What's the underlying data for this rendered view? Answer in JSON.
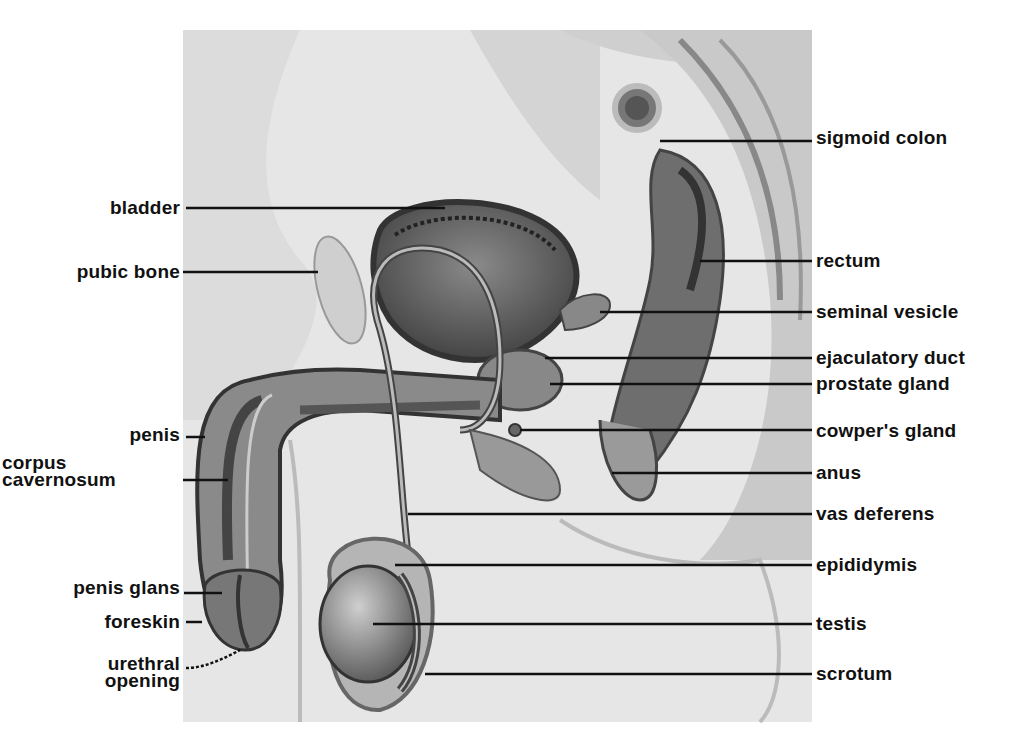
{
  "diagram": {
    "colors": {
      "background": "#ffffff",
      "ink": "#111111",
      "illustration_bg": "#e4e4e4"
    },
    "labels_left": [
      {
        "id": "bladder",
        "text": "bladder",
        "y": 208
      },
      {
        "id": "pubic-bone",
        "text": "pubic bone",
        "y": 272
      },
      {
        "id": "penis",
        "text": "penis",
        "y": 434
      },
      {
        "id": "corpus-cavernosum",
        "line1": "corpus",
        "line2": "cavernosum",
        "y": 480
      },
      {
        "id": "penis-glans",
        "text": "penis glans",
        "y": 587
      },
      {
        "id": "foreskin",
        "text": "foreskin",
        "y": 621
      },
      {
        "id": "urethral-opening",
        "line1": "urethral",
        "line2": "opening",
        "y": 668
      }
    ],
    "labels_right": [
      {
        "id": "sigmoid-colon",
        "text": "sigmoid colon",
        "y": 138
      },
      {
        "id": "rectum",
        "text": "rectum",
        "y": 261
      },
      {
        "id": "seminal-vesicle",
        "text": "seminal vesicle",
        "y": 312
      },
      {
        "id": "ejaculatory-duct",
        "text": "ejaculatory duct",
        "y": 358
      },
      {
        "id": "prostate-gland",
        "text": "prostate gland",
        "y": 384
      },
      {
        "id": "cowpers-gland",
        "text": "cowper's gland",
        "y": 431
      },
      {
        "id": "anus",
        "text": "anus",
        "y": 473
      },
      {
        "id": "vas-deferens",
        "text": "vas deferens",
        "y": 514
      },
      {
        "id": "epididymis",
        "text": "epididymis",
        "y": 565
      },
      {
        "id": "testis",
        "text": "testis",
        "y": 624
      },
      {
        "id": "scrotum",
        "text": "scrotum",
        "y": 674
      }
    ]
  }
}
